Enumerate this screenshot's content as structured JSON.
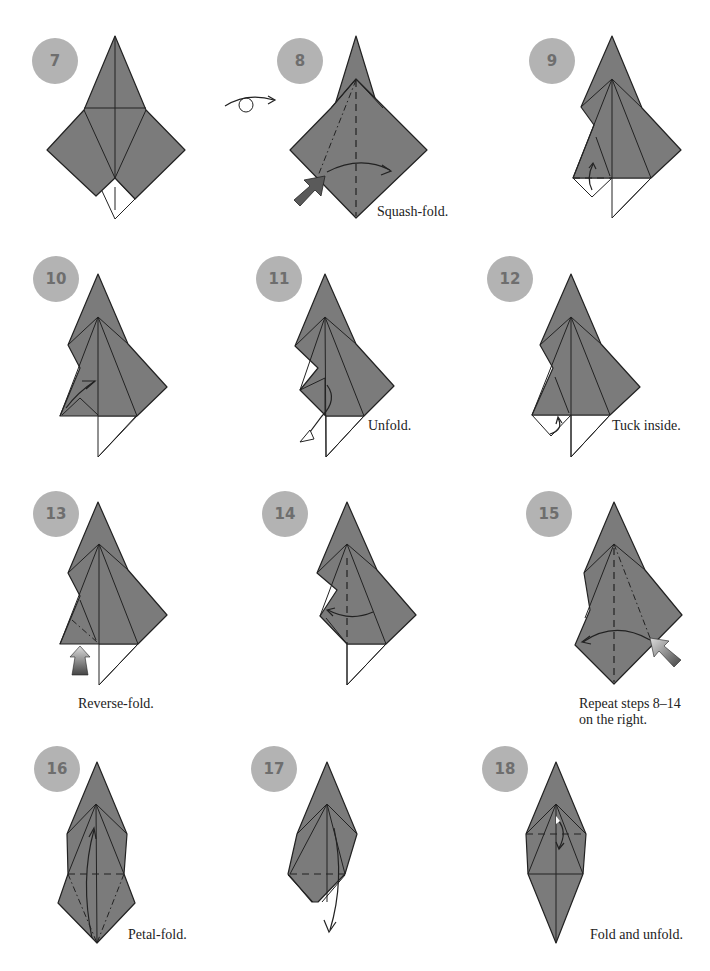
{
  "diagram": {
    "type": "origami-instructions",
    "colors": {
      "paper": "#7b7b7b",
      "badge": "#b3b3b3",
      "badge_text": "#6e6e6e",
      "lines": "#222222"
    },
    "steps": [
      {
        "number": "7",
        "caption": ""
      },
      {
        "number": "8",
        "caption": "Squash-fold."
      },
      {
        "number": "9",
        "caption": ""
      },
      {
        "number": "10",
        "caption": ""
      },
      {
        "number": "11",
        "caption": "Unfold."
      },
      {
        "number": "12",
        "caption": "Tuck inside."
      },
      {
        "number": "13",
        "caption": "Reverse-fold."
      },
      {
        "number": "14",
        "caption": ""
      },
      {
        "number": "15",
        "caption": "Repeat steps 8–14",
        "caption2": "on the right."
      },
      {
        "number": "16",
        "caption": "Petal-fold."
      },
      {
        "number": "17",
        "caption": ""
      },
      {
        "number": "18",
        "caption": "Fold and unfold."
      }
    ],
    "symbols": {
      "turn_over": "turn-over-icon"
    }
  }
}
